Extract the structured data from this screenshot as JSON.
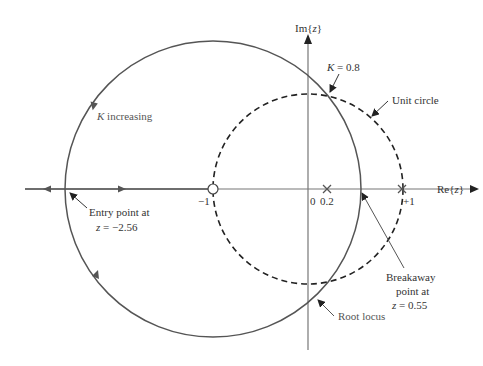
{
  "diagram": {
    "type": "root-locus-z-plane",
    "axes": {
      "real_label_prefix": "Re{",
      "real_label_var": "z",
      "real_label_suffix": "}",
      "imag_label_prefix": "Im{",
      "imag_label_var": "z",
      "imag_label_suffix": "}"
    },
    "tick_labels": {
      "minus_one": "−1",
      "zero": "0",
      "zero_two": "0.2",
      "plus_one": "+1"
    },
    "poles": [
      0.2,
      1.0
    ],
    "zeros": [
      -1.0
    ],
    "annotations": {
      "k_increasing_var": "K",
      "k_increasing_text": " increasing",
      "k_value_var": "K",
      "k_value_text": " = 0.8",
      "unit_circle": "Unit circle",
      "entry_line1": "Entry point at",
      "entry_line2_var": "z",
      "entry_line2_text": " = −2.56",
      "breakaway_line1": "Breakaway",
      "breakaway_line2": "point at",
      "breakaway_line3_var": "z",
      "breakaway_line3_text": " = 0.55",
      "root_locus": "Root locus"
    },
    "colors": {
      "locus": "#555555",
      "unit_circle": "#222222",
      "axes": "#666666"
    }
  }
}
